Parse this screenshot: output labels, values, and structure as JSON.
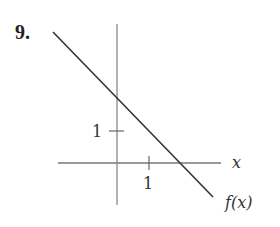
{
  "problem": {
    "number": "9."
  },
  "graph": {
    "x_axis_label": "x",
    "curve_label": "f(x)",
    "x_tick_label": "1",
    "y_tick_label": "1",
    "function": "f(x) = -x + 2",
    "line_color": "#333333",
    "axis_color": "#777777"
  }
}
